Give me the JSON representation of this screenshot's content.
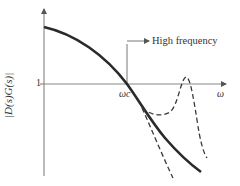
{
  "diagram": {
    "y_axis_label": "|D(s)G(s)|",
    "y_tick_label": "1",
    "x_axis_label": "ω",
    "crossover_label": "ωc",
    "annotation": "High frequency",
    "colors": {
      "solid_curve": "#2a2a2a",
      "dashed_curve": "#3a3a3a",
      "axes": "#777777"
    },
    "curves": [
      {
        "name": "nominal-magnitude",
        "style": "solid"
      },
      {
        "name": "resonant-peak-variant",
        "style": "dashed"
      },
      {
        "name": "steep-rolloff-variant",
        "style": "dashed"
      }
    ]
  }
}
